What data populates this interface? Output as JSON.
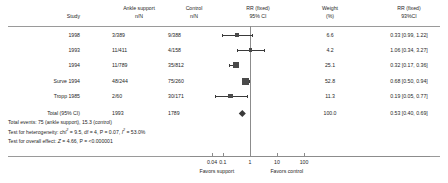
{
  "chart_data": {
    "type": "forest",
    "title": "RR (fixed) 95% CI",
    "xlabel": "",
    "scale": "log",
    "xlim": [
      0.04,
      100
    ],
    "null_value": 1,
    "axis_ticks": [
      "0.04",
      "0.1",
      "1",
      "10",
      "100"
    ],
    "axis_tick_values": [
      0.04,
      0.1,
      1,
      10,
      100
    ],
    "favors_left": "Favors support",
    "favors_right": "Favors control",
    "columns": {
      "study": "Study",
      "treatment_group": "Ankle support",
      "treatment_unit": "n/N",
      "control_group": "Control",
      "control_unit": "n/N",
      "effect_header": "RR (fixed)",
      "effect_ci": "95% CI",
      "weight_header": "Weight",
      "weight_unit": "(%)",
      "effect_value_header": "RR (fixed)",
      "effect_value_ci": "93%CI"
    },
    "rows": [
      {
        "study": "1998",
        "treatment": "3/389",
        "control": "9/388",
        "weight": "6.6",
        "effect": "0.33 [0.99, 1.22]",
        "rr": 0.33,
        "ci_low": 0.09,
        "ci_high": 1.22
      },
      {
        "study": "1993",
        "treatment": "11/411",
        "control": "4/158",
        "weight": "4.2",
        "effect": "1.06 [0.34, 3.27]",
        "rr": 1.06,
        "ci_low": 0.34,
        "ci_high": 3.27
      },
      {
        "study": "1994",
        "treatment": "11/789",
        "control": "35/812",
        "weight": "25.1",
        "effect": "0.32 [0.17, 0.36]",
        "rr": 0.32,
        "ci_low": 0.17,
        "ci_high": 0.36
      },
      {
        "study": "Surve 1994",
        "treatment": "48/244",
        "control": "75/260",
        "weight": "52.8",
        "effect": "0.68 [0.50, 0.94]",
        "rr": 0.68,
        "ci_low": 0.5,
        "ci_high": 0.94
      },
      {
        "study": "Tropp 1985",
        "treatment": "2/60",
        "control": "30/171",
        "weight": "11.3",
        "effect": "0.19 [0.05, 0.77]",
        "rr": 0.19,
        "ci_low": 0.05,
        "ci_high": 0.77
      }
    ],
    "total": {
      "study": "Total (95% CI)",
      "treatment": "1993",
      "control": "1789",
      "weight": "100.0",
      "effect": "0.53 [0.40, 0.69]",
      "rr": 0.53,
      "ci_low": 0.4,
      "ci_high": 0.69
    }
  },
  "statistics": {
    "total_events": "Total events: 75 (ankle support), 15.3 (control)",
    "heterogeneity_prefix": "Test for heterogeneity: chi",
    "heterogeneity_body": " = 9.5, df = 4, P = 0.07, ",
    "heterogeneity_i": " = 53.0%",
    "overall_prefix": "Test for overall effect: ",
    "overall_body": " = 4.66, P = <0.000001",
    "chi_symbol": "2",
    "i_symbol": "2",
    "z_symbol": "Z",
    "i_letter": "I"
  }
}
